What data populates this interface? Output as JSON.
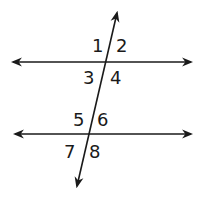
{
  "diagram": {
    "type": "parallel-lines-cut-by-transversal",
    "colors": {
      "line": "#1a1a1a",
      "background": "#ffffff"
    },
    "lines": [
      {
        "name": "upper-line",
        "x1": 13,
        "y1": 62,
        "x2": 191,
        "y2": 62
      },
      {
        "name": "lower-line",
        "x1": 15,
        "y1": 134,
        "x2": 191,
        "y2": 134
      },
      {
        "name": "transversal",
        "x1": 117,
        "y1": 13,
        "x2": 77,
        "y2": 186
      }
    ],
    "angles": [
      {
        "label": "1",
        "x": 92,
        "y": 52
      },
      {
        "label": "2",
        "x": 116,
        "y": 52
      },
      {
        "label": "3",
        "x": 83,
        "y": 84
      },
      {
        "label": "4",
        "x": 110,
        "y": 84
      },
      {
        "label": "5",
        "x": 73,
        "y": 126
      },
      {
        "label": "6",
        "x": 97,
        "y": 126
      },
      {
        "label": "7",
        "x": 64,
        "y": 158
      },
      {
        "label": "8",
        "x": 89,
        "y": 158
      }
    ]
  }
}
